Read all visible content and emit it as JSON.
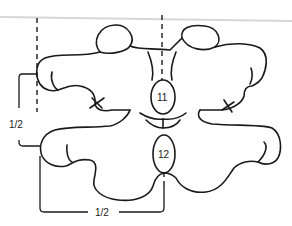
{
  "diagram": {
    "labels": {
      "part_upper": "11",
      "part_lower": "12",
      "dim_vertical": "1/2",
      "dim_horizontal": "1/2"
    },
    "colors": {
      "stroke": "#1a1a1a",
      "top_rule": "#d6d6d6",
      "background": "#ffffff"
    }
  }
}
